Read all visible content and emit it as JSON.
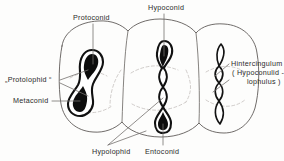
{
  "figure": {
    "colors": {
      "outline": "#4a4a4a",
      "crest_stroke": "#0a0a0a",
      "crest_fill": "#0d0d0d",
      "dashed_internal": "#b9b4b0",
      "leader": "#6e6a67",
      "text": "#2b2b2b",
      "background": "#fdfdfc"
    },
    "labels": {
      "protoconid": "Protoconid",
      "hypoconid": "Hypoconid",
      "protolophid": "„Protolophid “",
      "metaconid": "Metaconid",
      "hypolophid": "Hypolophid",
      "entoconid": "Entoconid",
      "hintercingulum_line1": "Hintercingulum",
      "hintercingulum_line2": "( Hypoconulid -",
      "hintercingulum_line3": "lophulus )"
    },
    "structures": [
      {
        "name": "anterior-lobe-crest",
        "shape": "sigmoid",
        "cusps": [
          "Protoconid",
          "Metaconid"
        ],
        "crest": "„Protolophid “"
      },
      {
        "name": "middle-lobe-crest",
        "shape": "serpentine-chain",
        "cusps": [
          "Hypoconid",
          "Entoconid"
        ],
        "crest": "Hypolophid"
      },
      {
        "name": "posterior-lobe-crest",
        "shape": "narrow-lens-chain",
        "cusps": [
          "Hypoconulid"
        ],
        "crest": "Hintercingulum"
      }
    ]
  }
}
